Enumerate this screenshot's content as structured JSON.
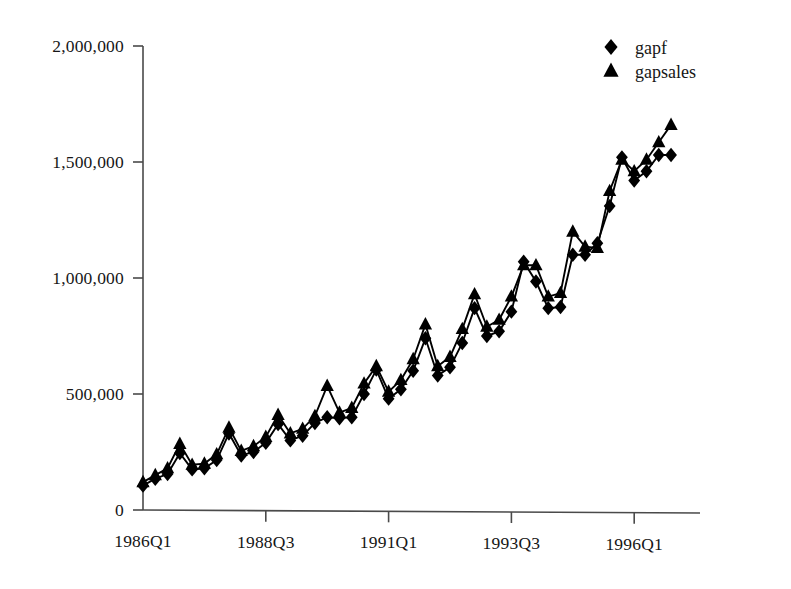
{
  "chart_data": {
    "type": "line",
    "title": "",
    "subtitle": "",
    "xlabel": "",
    "ylabel": "",
    "grid": false,
    "legend_position": "top-right",
    "ylim": [
      0,
      2000000
    ],
    "ytick_labels": [
      "2,000,000",
      "1,500,000",
      "1,000,000",
      "500,000",
      "0"
    ],
    "ytick_values": [
      2000000,
      1500000,
      1000000,
      500000,
      0
    ],
    "xtick_labels": [
      "1986Q1",
      "1988Q3",
      "1991Q1",
      "1993Q3",
      "1996Q1"
    ],
    "xtick_indices": [
      0,
      10,
      20,
      30,
      40
    ],
    "x": [
      "1986Q1",
      "1986Q2",
      "1986Q3",
      "1986Q4",
      "1987Q1",
      "1987Q2",
      "1987Q3",
      "1987Q4",
      "1988Q1",
      "1988Q2",
      "1988Q3",
      "1988Q4",
      "1989Q1",
      "1989Q2",
      "1989Q3",
      "1989Q4",
      "1990Q1",
      "1990Q2",
      "1990Q3",
      "1990Q4",
      "1991Q1",
      "1991Q2",
      "1991Q3",
      "1991Q4",
      "1992Q1",
      "1992Q2",
      "1992Q3",
      "1992Q4",
      "1993Q1",
      "1993Q2",
      "1993Q3",
      "1993Q4",
      "1994Q1",
      "1994Q2",
      "1994Q3",
      "1994Q4",
      "1995Q1",
      "1995Q2",
      "1995Q3",
      "1995Q4",
      "1996Q1",
      "1996Q2",
      "1996Q3",
      "1996Q4"
    ],
    "series": [
      {
        "name": "gapf",
        "marker": "diamond",
        "values": [
          105000,
          135000,
          155000,
          245000,
          175000,
          180000,
          215000,
          330000,
          235000,
          250000,
          290000,
          370000,
          300000,
          320000,
          375000,
          400000,
          395000,
          400000,
          500000,
          605000,
          480000,
          520000,
          600000,
          740000,
          580000,
          615000,
          720000,
          870000,
          750000,
          770000,
          855000,
          1070000,
          985000,
          870000,
          875000,
          1100000,
          1100000,
          1150000,
          1310000,
          1520000,
          1420000,
          1460000,
          1530000,
          1530000
        ]
      },
      {
        "name": "gapsales",
        "marker": "triangle",
        "values": [
          120000,
          150000,
          180000,
          285000,
          195000,
          200000,
          240000,
          355000,
          255000,
          275000,
          315000,
          410000,
          330000,
          350000,
          405000,
          535000,
          420000,
          440000,
          545000,
          620000,
          510000,
          560000,
          650000,
          800000,
          620000,
          660000,
          780000,
          930000,
          790000,
          820000,
          920000,
          1055000,
          1055000,
          920000,
          935000,
          1200000,
          1135000,
          1130000,
          1375000,
          1510000,
          1460000,
          1510000,
          1585000,
          1660000
        ]
      }
    ],
    "legend": [
      {
        "marker": "diamond",
        "label": "gapf"
      },
      {
        "marker": "triangle",
        "label": "gapsales"
      }
    ],
    "colors": {
      "series_gapf": "#000000",
      "series_gapsales": "#000000",
      "axis": "#4a4a4a",
      "background": "#ffffff",
      "text": "#161616"
    }
  }
}
